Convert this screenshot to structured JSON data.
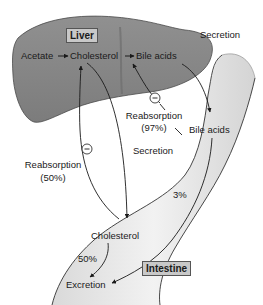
{
  "diagram": {
    "organs": {
      "liver": "Liver",
      "intestine": "Intestine"
    },
    "liver_pathway": {
      "acetate": "Acetate",
      "cholesterol": "Cholesterol",
      "bile_acids": "Bile acids"
    },
    "labels": {
      "secretion_top": "Secretion",
      "reabsorption_bile": "Reabsorption",
      "reabsorption_bile_pct": "(97%)",
      "bile_acids_intestine": "Bile acids",
      "secretion_middle": "Secretion",
      "reabsorption_chol": "Reabsorption",
      "reabsorption_chol_pct": "(50%)",
      "bile_excretion_pct": "3%",
      "cholesterol_intestine": "Cholesterol",
      "chol_excretion_pct": "50%",
      "excretion": "Excretion"
    },
    "inhibition_symbol": "−",
    "colors": {
      "liver_fill": "#8a8a8a",
      "liver_stroke": "#4a4a4a",
      "intestine_fill": "#e6e6e6",
      "intestine_stroke": "#333333",
      "arrow": "#1a1a1a",
      "label_box_fill": "#c8c8c8"
    }
  }
}
